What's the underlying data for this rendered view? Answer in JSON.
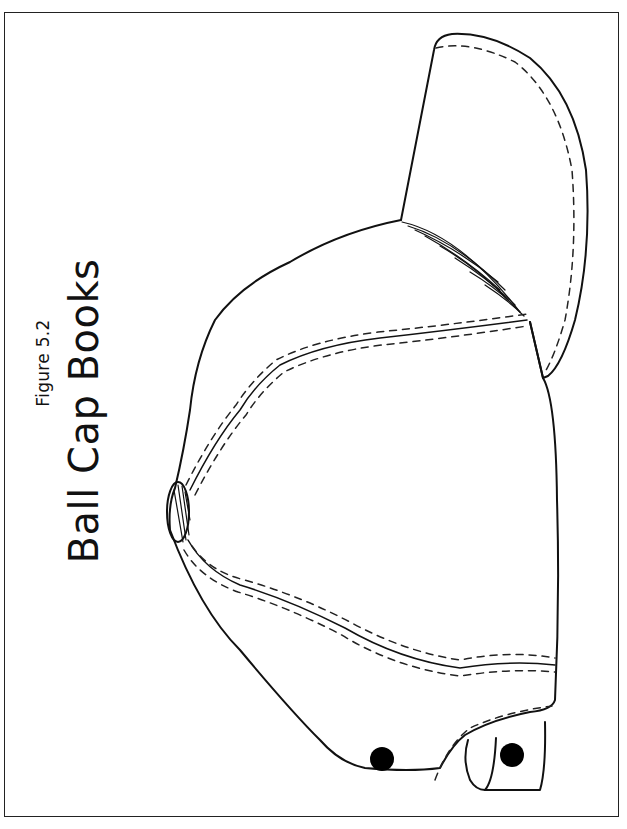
{
  "figure": {
    "label": "Figure 5.2",
    "title": "Ball Cap Books"
  },
  "illustration": {
    "subject": "ball-cap-outline",
    "parts": [
      "brim",
      "crown",
      "top-button",
      "seams",
      "stitching",
      "eyelets",
      "snapback-strap"
    ],
    "colors": {
      "line": "#111111",
      "background": "#ffffff"
    }
  }
}
